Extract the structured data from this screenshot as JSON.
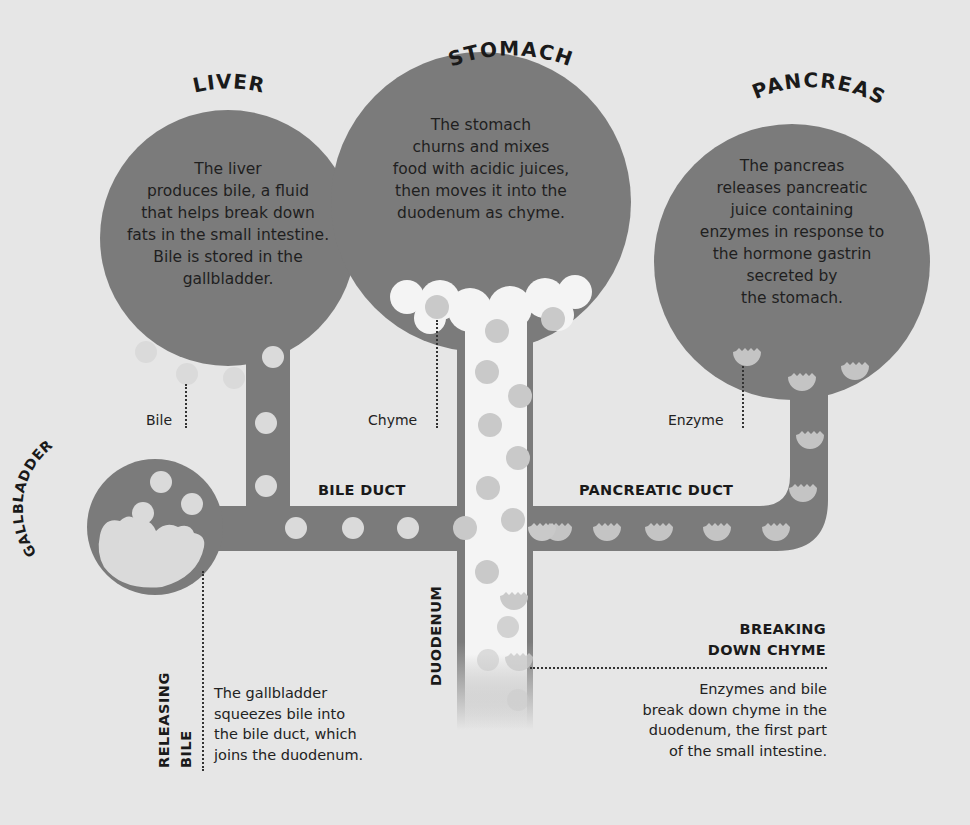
{
  "colors": {
    "background": "#e6e6e6",
    "organ": "#7b7b7b",
    "bile_dot": "#dadada",
    "enzyme_dot": "#c4c4c4",
    "chyme": "#f4f4f4",
    "chyme_dot": "#c9c9c9",
    "text": "#1e1e1e"
  },
  "organs": {
    "liver": {
      "title": "LIVER",
      "lines": [
        "The liver",
        "produces bile, a fluid",
        "that helps break down",
        "fats in the small intestine.",
        "Bile is stored in the",
        "gallbladder."
      ]
    },
    "stomach": {
      "title": "STOMACH",
      "lines": [
        "The stomach",
        "churns and mixes",
        "food with acidic juices,",
        "then moves it into the",
        "duodenum as chyme."
      ]
    },
    "pancreas": {
      "title": "PANCREAS",
      "lines": [
        "The pancreas",
        "releases pancreatic",
        "juice containing",
        "enzymes in response to",
        "the hormone gastrin",
        "secreted by",
        "the stomach."
      ]
    },
    "gallbladder": {
      "title": "GALLBLADDER"
    },
    "duodenum": {
      "title": "DUODENUM"
    }
  },
  "labels": {
    "bile": "Bile",
    "chyme": "Chyme",
    "enzyme": "Enzyme",
    "bile_duct": "BILE DUCT",
    "pancreatic_duct": "PANCREATIC DUCT"
  },
  "callouts": {
    "releasing_bile": {
      "title_lines": [
        "RELEASING",
        "BILE"
      ],
      "lines": [
        "The gallbladder",
        "squeezes bile into",
        "the bile duct, which",
        "joins the duodenum."
      ]
    },
    "breaking_down_chyme": {
      "title_lines": [
        "BREAKING",
        "DOWN CHYME"
      ],
      "lines": [
        "Enzymes and bile",
        "break down chyme in the",
        "duodenum, the first part",
        "of the small intestine."
      ]
    }
  }
}
